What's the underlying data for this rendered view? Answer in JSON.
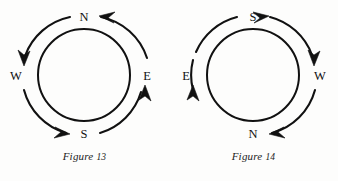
{
  "page": {
    "background_color": "#fdfdfc",
    "ink_color": "#111111"
  },
  "figures": [
    {
      "id": "figure-13",
      "caption_word": "Figure",
      "caption_number": "13",
      "caption_full": "Figure 13",
      "labels": {
        "top": "N",
        "right": "E",
        "bottom": "S",
        "left": "W"
      },
      "arrows": [
        {
          "name": "arrow-bottom-to-right",
          "from_label": "S",
          "to_label": "E",
          "head_at": "E",
          "head_direction": "up"
        },
        {
          "name": "arrow-right-to-top",
          "from_label": "E",
          "to_label": "N",
          "head_at": "N",
          "head_direction": "left"
        },
        {
          "name": "arrow-top-to-left",
          "from_label": "N",
          "to_label": "W",
          "head_at": "W",
          "head_direction": "down"
        },
        {
          "name": "arrow-left-to-bottom",
          "from_label": "W",
          "to_label": "S",
          "head_at": "S",
          "head_direction": "right"
        }
      ]
    },
    {
      "id": "figure-14",
      "caption_word": "Figure",
      "caption_number": "14",
      "caption_full": "Figure 14",
      "labels": {
        "top": "S",
        "right": "W",
        "bottom": "N",
        "left": "E"
      },
      "arrows": [
        {
          "name": "arrow-left-to-top",
          "from_label": "E",
          "to_label": "S",
          "head_at": "S",
          "head_direction": "right"
        },
        {
          "name": "arrow-top-to-right",
          "from_label": "S",
          "to_label": "W",
          "head_at": "W",
          "head_direction": "down"
        },
        {
          "name": "arrow-right-to-bottom",
          "from_label": "W",
          "to_label": "N",
          "head_at": "N",
          "head_direction": "left"
        },
        {
          "name": "arrow-bottom-to-left",
          "from_label": "N",
          "to_label": "E",
          "head_at": "E",
          "head_direction": "up"
        }
      ]
    }
  ]
}
